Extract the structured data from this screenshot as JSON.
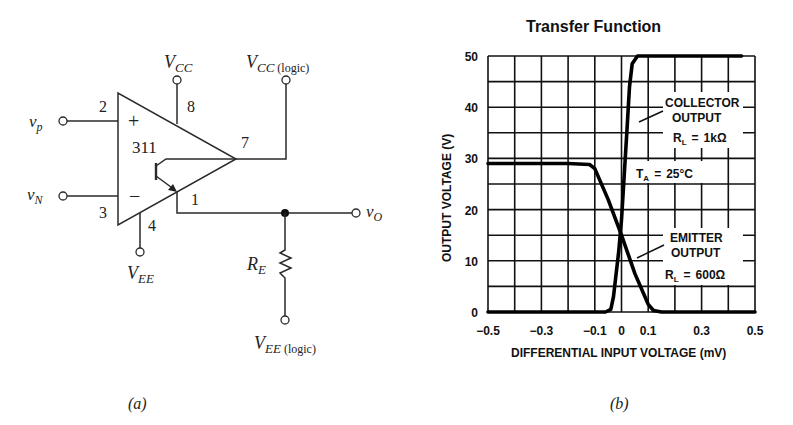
{
  "figure_a": {
    "caption": "(a)",
    "chip_label": "311",
    "plus_sign": "+",
    "minus_sign": "−",
    "pins": {
      "noninv": "2",
      "inv": "3",
      "vcc": "8",
      "vee": "4",
      "out": "7",
      "emitter": "1"
    },
    "terminals": {
      "vp": {
        "main": "v",
        "sub": "p"
      },
      "vn": {
        "main": "v",
        "sub": "N"
      },
      "vo": {
        "main": "v",
        "sub": "O"
      },
      "vcc": {
        "main": "V",
        "sub": "CC"
      },
      "vcc_logic": {
        "main": "V",
        "sub": "CC",
        "extra": "(logic)"
      },
      "vee": {
        "main": "V",
        "sub": "EE"
      },
      "vee_logic": {
        "main": "V",
        "sub": "EE",
        "extra": "(logic)"
      }
    },
    "resistor": {
      "main": "R",
      "sub": "E"
    }
  },
  "figure_b": {
    "caption": "(b)"
  },
  "chart_data": {
    "type": "line",
    "title": "Transfer Function",
    "xlabel": "DIFFERENTIAL INPUT VOLTAGE (mV)",
    "ylabel": "OUTPUT VOLTAGE (V)",
    "xlim": [
      -0.5,
      0.5
    ],
    "ylim": [
      0,
      50
    ],
    "xticks": [
      -0.5,
      -0.3,
      -0.1,
      0,
      0.1,
      0.3,
      0.5
    ],
    "xtick_labels": [
      "−0.5",
      "−0.3",
      "−0.1",
      "0",
      "0.1",
      "0.3",
      "0.5"
    ],
    "yticks": [
      0,
      10,
      20,
      30,
      40,
      50
    ],
    "ytick_labels": [
      "0",
      "10",
      "20",
      "30",
      "40",
      "50"
    ],
    "grid": true,
    "series": [
      {
        "name": "Collector Output",
        "condition": "RL = 1kΩ",
        "x": [
          -0.5,
          -0.06,
          -0.04,
          -0.03,
          -0.01,
          0.0,
          0.02,
          0.03,
          0.04,
          0.06,
          0.45
        ],
        "y": [
          0,
          0,
          0.5,
          3,
          12,
          18,
          35,
          44,
          48.5,
          50,
          50
        ]
      },
      {
        "name": "Emitter Output",
        "condition": "RL = 600Ω",
        "x": [
          -0.5,
          -0.2,
          -0.12,
          -0.1,
          -0.05,
          0.0,
          0.05,
          0.1,
          0.12,
          0.15,
          0.5
        ],
        "y": [
          29,
          29,
          28.8,
          28,
          22,
          15,
          7.5,
          1.5,
          0.3,
          0,
          0
        ]
      }
    ],
    "annotations": [
      {
        "lines": [
          "COLLECTOR",
          "OUTPUT"
        ],
        "sub": "RL = 1kΩ"
      },
      {
        "lines": [
          "T",
          "= 25°C"
        ],
        "label": "TA = 25°C"
      },
      {
        "lines": [
          "EMITTER",
          "OUTPUT"
        ],
        "sub": "RL = 600Ω"
      }
    ],
    "annotation_text": {
      "collector_1": "COLLECTOR",
      "collector_2": "OUTPUT",
      "collector_rl": "1kΩ",
      "ta": "25°C",
      "emitter_1": "EMITTER",
      "emitter_2": "OUTPUT",
      "emitter_rl": "600Ω",
      "r": "R",
      "l": "L",
      "t": "T",
      "a": "A",
      "eq": "="
    }
  }
}
